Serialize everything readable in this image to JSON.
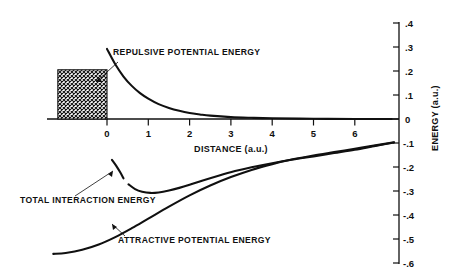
{
  "figure": {
    "background": "#ffffff",
    "ink_color": "#101010"
  },
  "axes": {
    "x": {
      "title": "DISTANCE (a.u.)",
      "tick_labels": [
        "0",
        "1",
        "2",
        "3",
        "4",
        "5",
        "6"
      ],
      "tick_values": [
        0,
        1,
        2,
        3,
        4,
        5,
        6
      ],
      "range": [
        -1.45,
        7.1
      ]
    },
    "y": {
      "title": "ENERGY (a.u.)",
      "tick_labels": [
        ".4",
        ".3",
        ".2",
        ".1",
        "0",
        "-.1",
        "-.2",
        "-.3",
        "-.4",
        "-.5",
        "-.6"
      ],
      "tick_values": [
        0.4,
        0.3,
        0.2,
        0.1,
        0,
        -0.1,
        -0.2,
        -0.3,
        -0.4,
        -0.5,
        -0.6
      ],
      "range": [
        -0.65,
        0.43
      ]
    }
  },
  "annotations": {
    "repulsive": {
      "label": "REPULSIVE POTENTIAL ENERGY",
      "text_x": 113,
      "text_y": 55,
      "leader": "M 118 62 L 96 82"
    },
    "total": {
      "label": "TOTAL INTERACTION ENERGY",
      "text_x": 20,
      "text_y": 203,
      "leader": "M 75 196 L 113 171"
    },
    "attractive": {
      "label": "ATTRACTIVE POTENTIAL ENERGY",
      "text_x": 118,
      "text_y": 243,
      "leader": "M 125 236 L 112 224"
    }
  },
  "hatch_region": {
    "name": "cross-hatched-core-region",
    "x_start": -1.19,
    "x_end": 0,
    "y_bottom": 0,
    "y_top": 0.205
  },
  "chart_data": {
    "type": "line",
    "title": "",
    "xlabel": "DISTANCE (a.u.)",
    "ylabel": "ENERGY (a.u.)",
    "xlim": [
      -1.45,
      7.1
    ],
    "ylim": [
      -0.65,
      0.43
    ],
    "grid": false,
    "legend": "inline-annotations",
    "series": [
      {
        "name": "REPULSIVE POTENTIAL ENERGY",
        "x": [
          0.0,
          0.2,
          0.4,
          0.6,
          0.8,
          1.0,
          1.25,
          1.5,
          1.75,
          2.0,
          2.25,
          2.5,
          3.0,
          3.5,
          4.0,
          5.0,
          6.0,
          6.9
        ],
        "y": [
          0.292,
          0.228,
          0.177,
          0.138,
          0.108,
          0.085,
          0.062,
          0.046,
          0.034,
          0.025,
          0.019,
          0.014,
          0.008,
          0.005,
          0.003,
          0.001,
          0.0,
          0.0
        ]
      },
      {
        "name": "ATTRACTIVE POTENTIAL ENERGY",
        "x": [
          -1.3,
          -1.0,
          -0.6,
          -0.2,
          0.2,
          0.6,
          1.0,
          1.5,
          2.0,
          2.5,
          3.0,
          3.5,
          4.0,
          4.5,
          5.0,
          5.5,
          6.0,
          6.5,
          6.95
        ],
        "y": [
          -0.562,
          -0.558,
          -0.545,
          -0.523,
          -0.492,
          -0.455,
          -0.415,
          -0.365,
          -0.318,
          -0.277,
          -0.242,
          -0.212,
          -0.188,
          -0.168,
          -0.152,
          -0.138,
          -0.124,
          -0.11,
          -0.097
        ]
      },
      {
        "name": "TOTAL INTERACTION ENERGY",
        "segments": [
          {
            "x": [
              0.12,
              0.22,
              0.32,
              0.4
            ],
            "y": [
              -0.17,
              -0.194,
              -0.222,
              -0.247
            ]
          },
          {
            "x": [
              0.52,
              0.68,
              0.85,
              1.05,
              1.25,
              1.5,
              1.75,
              2.0,
              2.3,
              2.7,
              3.1,
              3.5,
              4.0,
              4.5,
              5.0,
              5.5,
              6.0,
              6.5,
              6.95
            ],
            "y": [
              -0.272,
              -0.292,
              -0.303,
              -0.308,
              -0.306,
              -0.298,
              -0.287,
              -0.274,
              -0.257,
              -0.236,
              -0.217,
              -0.201,
              -0.184,
              -0.169,
              -0.156,
              -0.142,
              -0.128,
              -0.112,
              -0.098
            ]
          }
        ]
      }
    ]
  }
}
